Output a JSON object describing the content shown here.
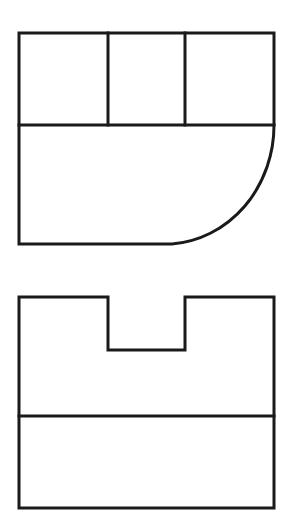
{
  "diagram": {
    "type": "orthographic-views",
    "stroke_color": "#1a1a1a",
    "background": "#ffffff",
    "views": [
      {
        "name": "top-view",
        "outline": {
          "x1": 19,
          "y1": 33,
          "x2": 274,
          "y2": 244
        },
        "divider_y": 125,
        "partitions_x": [
          108,
          185
        ],
        "rounded_corner": {
          "corner": "bottom-right",
          "start": [
            274,
            125
          ],
          "end": [
            172,
            244
          ]
        }
      },
      {
        "name": "front-view",
        "outline": {
          "x1": 19,
          "y1": 297,
          "x2": 274,
          "y2": 508
        },
        "notch": {
          "x1": 108,
          "x2": 185,
          "depth_y": 350
        },
        "divider_y": 416
      }
    ]
  }
}
